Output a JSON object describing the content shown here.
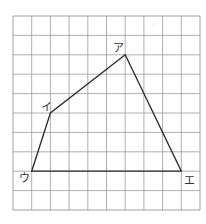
{
  "diagram": {
    "type": "quadrilateral-on-grid",
    "grid": {
      "columns": 10,
      "rows": 10,
      "origin_px": [
        13,
        16
      ],
      "cell_w": 18.7,
      "cell_h": 19.4,
      "line_color": "#9a9a9a",
      "border_color": "#8a8a8a"
    },
    "shape": {
      "stroke": "#2a2a2a",
      "vertices": [
        {
          "label": "ア",
          "col": 6,
          "row": 2
        },
        {
          "label": "イ",
          "col": 2,
          "row": 5
        },
        {
          "label": "ウ",
          "col": 1,
          "row": 8
        },
        {
          "label": "エ",
          "col": 9,
          "row": 8
        }
      ]
    },
    "labels": {
      "a": "ア",
      "i": "イ",
      "u": "ウ",
      "e": "エ"
    }
  }
}
